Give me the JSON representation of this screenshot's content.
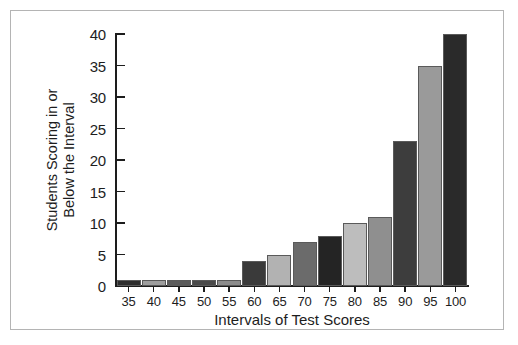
{
  "chart_data": {
    "type": "bar",
    "title": "",
    "xlabel": "Intervals of Test Scores",
    "ylabel": "Students Scoring in or Below the Interval",
    "ylabel_lines": [
      "Students Scoring in or",
      "Below the Interval"
    ],
    "categories": [
      "35",
      "40",
      "45",
      "50",
      "55",
      "60",
      "65",
      "70",
      "75",
      "80",
      "85",
      "90",
      "95",
      "100"
    ],
    "values": [
      1,
      1,
      1,
      1,
      1,
      4,
      5,
      7,
      8,
      10,
      11,
      23,
      35,
      40
    ],
    "bar_colors": [
      "#2d2d2d",
      "#9e9e9e",
      "#5b5b5b",
      "#4a4a4a",
      "#8c8c8c",
      "#3a3a3a",
      "#b2b2b2",
      "#6b6b6b",
      "#242424",
      "#bdbdbd",
      "#8f8f8f",
      "#3d3d3d",
      "#9a9a9a",
      "#2a2a2a"
    ],
    "ylim": [
      0,
      40
    ],
    "yticks": [
      "0",
      "5",
      "10",
      "15",
      "20",
      "25",
      "30",
      "35",
      "40"
    ],
    "ytick_values": [
      0,
      5,
      10,
      15,
      20,
      25,
      30,
      35,
      40
    ],
    "grid": false,
    "legend": null,
    "axis_color": "#1d1d1d",
    "frame_color": "#b4b4b4",
    "background": "#ffffff"
  }
}
